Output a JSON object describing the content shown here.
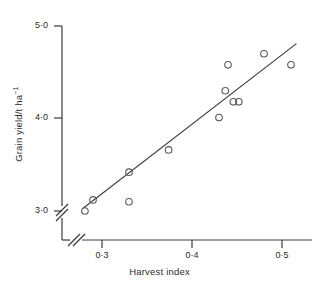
{
  "figure": {
    "background": "#ffffff",
    "ink_color": "#3a3a3a",
    "marker_color": "#5a5a6a"
  },
  "axes": {
    "y": {
      "label_prefix": "Grain yield/t ha",
      "label_exponent": "−1",
      "ticks": [
        {
          "value": 5.0,
          "text": "5·0",
          "px": 26
        },
        {
          "value": 4.0,
          "text": "4·0",
          "px": 118
        },
        {
          "value": 3.0,
          "text": "3·0",
          "px": 211
        }
      ],
      "break_mark": true,
      "range": [
        2.78,
        5.05
      ]
    },
    "x": {
      "label": "Harvest index",
      "ticks": [
        {
          "value": 0.3,
          "text": "0·3",
          "px": 102
        },
        {
          "value": 0.4,
          "text": "0·4",
          "px": 192
        },
        {
          "value": 0.5,
          "text": "0·5",
          "px": 282
        }
      ],
      "break_mark": true,
      "range": [
        0.262,
        0.525
      ]
    }
  },
  "chart_data": {
    "type": "scatter",
    "title": "",
    "xlabel": "Harvest index",
    "ylabel": "Grain yield/t ha−1",
    "xlim": [
      0.262,
      0.525
    ],
    "ylim": [
      2.78,
      5.05
    ],
    "grid": false,
    "legend": null,
    "marker": "open-circle",
    "points": [
      {
        "x": 0.281,
        "y": 3.0
      },
      {
        "x": 0.29,
        "y": 3.12
      },
      {
        "x": 0.33,
        "y": 3.42
      },
      {
        "x": 0.33,
        "y": 3.1
      },
      {
        "x": 0.374,
        "y": 3.66
      },
      {
        "x": 0.43,
        "y": 4.01
      },
      {
        "x": 0.437,
        "y": 4.3
      },
      {
        "x": 0.44,
        "y": 4.58
      },
      {
        "x": 0.446,
        "y": 4.18
      },
      {
        "x": 0.452,
        "y": 4.18
      },
      {
        "x": 0.48,
        "y": 4.7
      },
      {
        "x": 0.51,
        "y": 4.58
      }
    ],
    "fit_line": {
      "type": "linear-regression",
      "x_start": 0.279,
      "y_start": 3.03,
      "x_end": 0.516,
      "y_end": 4.81
    }
  }
}
